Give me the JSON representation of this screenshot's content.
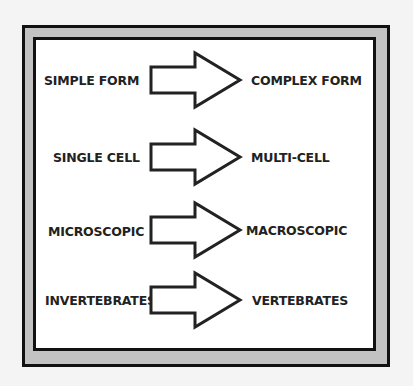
{
  "diagram": {
    "rows": [
      {
        "from": "SIMPLE FORM",
        "to": "COMPLEX FORM"
      },
      {
        "from": "SINGLE CELL",
        "to": "MULTI-CELL"
      },
      {
        "from": "MICROSCOPIC",
        "to": "MACROSCOPIC"
      },
      {
        "from": "INVERTEBRATES",
        "to": "VERTEBRATES"
      }
    ],
    "arrow_icon": "block-right-arrow",
    "colors": {
      "frame": "#111111",
      "band": "#c2c2c2",
      "panel": "#ffffff",
      "text": "#222222"
    }
  }
}
